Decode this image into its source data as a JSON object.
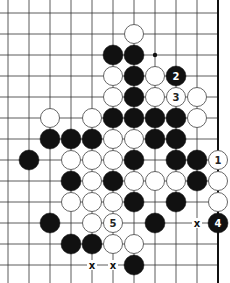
{
  "diagram": {
    "type": "go-board-fragment",
    "grid": {
      "columns": 11,
      "rows": 13,
      "origin_x": 8,
      "origin_y": 13,
      "spacing": 21,
      "right_edge_column": 10,
      "line_color": "#333333",
      "edge_color": "#111111"
    },
    "colors": {
      "black_stone": "#111111",
      "white_stone": "#ffffff",
      "white_outline": "#555555",
      "label_on_black": "#ffffff",
      "label_on_white": "#222222"
    },
    "stone_radius": 10,
    "star_points": [
      {
        "col": 7,
        "row": 2
      }
    ],
    "stones": [
      {
        "col": 6,
        "row": 1,
        "color": "white"
      },
      {
        "col": 5,
        "row": 2,
        "color": "black"
      },
      {
        "col": 6,
        "row": 2,
        "color": "black"
      },
      {
        "col": 5,
        "row": 3,
        "color": "white"
      },
      {
        "col": 6,
        "row": 3,
        "color": "black"
      },
      {
        "col": 7,
        "row": 3,
        "color": "white"
      },
      {
        "col": 8,
        "row": 3,
        "color": "black",
        "label": "2"
      },
      {
        "col": 5,
        "row": 4,
        "color": "white"
      },
      {
        "col": 6,
        "row": 4,
        "color": "black"
      },
      {
        "col": 7,
        "row": 4,
        "color": "white"
      },
      {
        "col": 8,
        "row": 4,
        "color": "white",
        "label": "3"
      },
      {
        "col": 9,
        "row": 4,
        "color": "white"
      },
      {
        "col": 2,
        "row": 5,
        "color": "white"
      },
      {
        "col": 4,
        "row": 5,
        "color": "white"
      },
      {
        "col": 5,
        "row": 5,
        "color": "black"
      },
      {
        "col": 6,
        "row": 5,
        "color": "black"
      },
      {
        "col": 7,
        "row": 5,
        "color": "black"
      },
      {
        "col": 8,
        "row": 5,
        "color": "black"
      },
      {
        "col": 9,
        "row": 5,
        "color": "white"
      },
      {
        "col": 2,
        "row": 6,
        "color": "black"
      },
      {
        "col": 3,
        "row": 6,
        "color": "black"
      },
      {
        "col": 4,
        "row": 6,
        "color": "black"
      },
      {
        "col": 5,
        "row": 6,
        "color": "white"
      },
      {
        "col": 6,
        "row": 6,
        "color": "white"
      },
      {
        "col": 7,
        "row": 6,
        "color": "black"
      },
      {
        "col": 8,
        "row": 6,
        "color": "black"
      },
      {
        "col": 1,
        "row": 7,
        "color": "black"
      },
      {
        "col": 3,
        "row": 7,
        "color": "white"
      },
      {
        "col": 4,
        "row": 7,
        "color": "white"
      },
      {
        "col": 5,
        "row": 7,
        "color": "white"
      },
      {
        "col": 6,
        "row": 7,
        "color": "black"
      },
      {
        "col": 8,
        "row": 7,
        "color": "black"
      },
      {
        "col": 9,
        "row": 7,
        "color": "black"
      },
      {
        "col": 10,
        "row": 7,
        "color": "white",
        "label": "1"
      },
      {
        "col": 3,
        "row": 8,
        "color": "black"
      },
      {
        "col": 4,
        "row": 8,
        "color": "white"
      },
      {
        "col": 5,
        "row": 8,
        "color": "black"
      },
      {
        "col": 6,
        "row": 8,
        "color": "white"
      },
      {
        "col": 7,
        "row": 8,
        "color": "white"
      },
      {
        "col": 8,
        "row": 8,
        "color": "white"
      },
      {
        "col": 9,
        "row": 8,
        "color": "black"
      },
      {
        "col": 10,
        "row": 8,
        "color": "white"
      },
      {
        "col": 3,
        "row": 9,
        "color": "white"
      },
      {
        "col": 4,
        "row": 9,
        "color": "white"
      },
      {
        "col": 5,
        "row": 9,
        "color": "white"
      },
      {
        "col": 6,
        "row": 9,
        "color": "black"
      },
      {
        "col": 8,
        "row": 9,
        "color": "black"
      },
      {
        "col": 10,
        "row": 9,
        "color": "white"
      },
      {
        "col": 2,
        "row": 10,
        "color": "black"
      },
      {
        "col": 4,
        "row": 10,
        "color": "white"
      },
      {
        "col": 5,
        "row": 10,
        "color": "white",
        "label": "5"
      },
      {
        "col": 7,
        "row": 10,
        "color": "black"
      },
      {
        "col": 10,
        "row": 10,
        "color": "black",
        "label": "4"
      },
      {
        "col": 3,
        "row": 11,
        "color": "black"
      },
      {
        "col": 4,
        "row": 11,
        "color": "black"
      },
      {
        "col": 5,
        "row": 11,
        "color": "white"
      },
      {
        "col": 6,
        "row": 11,
        "color": "white"
      },
      {
        "col": 6,
        "row": 12,
        "color": "black"
      }
    ],
    "marks": [
      {
        "col": 9,
        "row": 10,
        "label": "x"
      },
      {
        "col": 4,
        "row": 12,
        "label": "x"
      },
      {
        "col": 5,
        "row": 12,
        "label": "x"
      }
    ]
  }
}
